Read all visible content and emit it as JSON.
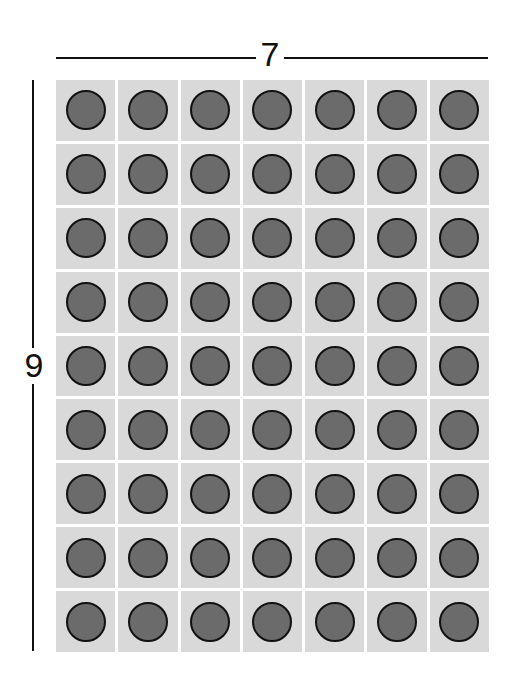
{
  "diagram": {
    "type": "array-model",
    "columns_label": "7",
    "rows_label": "9",
    "columns": 7,
    "rows": 9,
    "total_counters": 63,
    "colors": {
      "cell_background": "#d9d9d9",
      "counter_fill": "#6b6b6b",
      "counter_border": "#111111",
      "line": "#111111"
    }
  }
}
